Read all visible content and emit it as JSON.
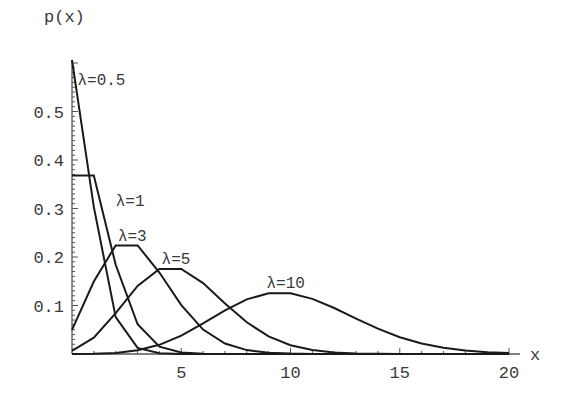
{
  "chart_data": {
    "type": "line",
    "title": "",
    "xlabel": "x",
    "ylabel": "p(x)",
    "xlim": [
      0,
      20
    ],
    "ylim": [
      0,
      0.6
    ],
    "grid": false,
    "legend": "inline labels",
    "x_ticks": [
      5,
      10,
      15,
      20
    ],
    "x_tick_labels": [
      "5",
      "10",
      "15",
      "20"
    ],
    "y_ticks": [
      0.1,
      0.2,
      0.3,
      0.4,
      0.5
    ],
    "y_tick_labels": [
      "0.1",
      "0.2",
      "0.3",
      "0.4",
      "0.5"
    ],
    "x": [
      0,
      1,
      2,
      3,
      4,
      5,
      6,
      7,
      8,
      9,
      10,
      11,
      12,
      13,
      14,
      15,
      16,
      17,
      18,
      19,
      20
    ],
    "series": [
      {
        "name": "λ=0.5",
        "label_pos": [
          0.25,
          0.555
        ],
        "values": [
          0.6065,
          0.3033,
          0.0758,
          0.0126,
          0.0016,
          0.0002,
          0,
          0,
          0,
          0,
          0,
          0,
          0,
          0,
          0,
          0,
          0,
          0,
          0,
          0,
          0
        ]
      },
      {
        "name": "λ=1",
        "label_pos": [
          2.0,
          0.305
        ],
        "values": [
          0.3679,
          0.3679,
          0.1839,
          0.0613,
          0.0153,
          0.0031,
          0.0005,
          0.0001,
          0,
          0,
          0,
          0,
          0,
          0,
          0,
          0,
          0,
          0,
          0,
          0,
          0
        ]
      },
      {
        "name": "λ=3",
        "label_pos": [
          2.1,
          0.233
        ],
        "values": [
          0.0498,
          0.1494,
          0.224,
          0.224,
          0.168,
          0.1008,
          0.0504,
          0.0216,
          0.0081,
          0.0027,
          0.0008,
          0.0002,
          0.0001,
          0,
          0,
          0,
          0,
          0,
          0,
          0,
          0
        ]
      },
      {
        "name": "λ=5",
        "label_pos": [
          4.1,
          0.185
        ],
        "values": [
          0.0067,
          0.0337,
          0.0842,
          0.1404,
          0.1755,
          0.1755,
          0.1462,
          0.1044,
          0.0653,
          0.0363,
          0.0181,
          0.0082,
          0.0034,
          0.0013,
          0.0005,
          0.0002,
          0,
          0,
          0,
          0,
          0
        ]
      },
      {
        "name": "λ=10",
        "label_pos": [
          8.9,
          0.137
        ],
        "values": [
          0.0,
          0.0005,
          0.0023,
          0.0076,
          0.0189,
          0.0378,
          0.0631,
          0.0901,
          0.1126,
          0.1251,
          0.1251,
          0.1137,
          0.0948,
          0.0729,
          0.0521,
          0.0347,
          0.0217,
          0.0128,
          0.0071,
          0.0037,
          0.0019
        ]
      }
    ]
  },
  "layout": {
    "plot_origin_px": [
      72,
      354
    ],
    "px_per_x": 21.85,
    "px_per_y": 485,
    "x_axis_end_px": 520,
    "y_axis_top_px": 60,
    "line_color": "#1a1a1a",
    "text_color": "#3a3a3a"
  }
}
